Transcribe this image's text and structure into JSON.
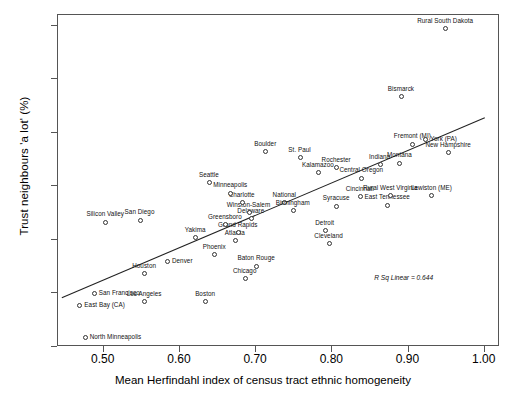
{
  "chart_data": {
    "type": "scatter",
    "title": "",
    "xlabel": "Mean Herfindahl index of census tract ethnic homogeneity",
    "ylabel": "Trust neighbours 'a lot' (%)",
    "xlim": [
      0.44,
      1.02
    ],
    "ylim": [
      20,
      82
    ],
    "xticks": [
      "0.50",
      "0.60",
      "0.70",
      "0.80",
      "0.90",
      "1.00"
    ],
    "xtick_values": [
      0.5,
      0.6,
      0.7,
      0.8,
      0.9,
      1.0
    ],
    "yticks": [
      "20",
      "30",
      "40",
      "50",
      "60",
      "70",
      "80"
    ],
    "ytick_values": [
      20,
      30,
      40,
      50,
      60,
      70,
      80
    ],
    "grid": false,
    "legend": null,
    "annotation": "R Sq Linear = 0.644",
    "fit": {
      "type": "linear",
      "r_squared": 0.644,
      "x_start": 0.445,
      "y_start": 29.2,
      "x_end": 1.0,
      "y_end": 62.8
    },
    "points": [
      {
        "label": "North Minneapolis",
        "x": 0.475,
        "y": 21.8,
        "pos": "right"
      },
      {
        "label": "East Bay (CA)",
        "x": 0.468,
        "y": 27.8,
        "pos": "right"
      },
      {
        "label": "San Francisco",
        "x": 0.487,
        "y": 30.0,
        "pos": "right"
      },
      {
        "label": "Los Angeles",
        "x": 0.553,
        "y": 28.6,
        "pos": "above"
      },
      {
        "label": "Boston",
        "x": 0.633,
        "y": 28.6,
        "pos": "above"
      },
      {
        "label": "Houston",
        "x": 0.553,
        "y": 33.8,
        "pos": "above"
      },
      {
        "label": "Denver",
        "x": 0.583,
        "y": 36.0,
        "pos": "right"
      },
      {
        "label": "Chicago",
        "x": 0.685,
        "y": 32.8,
        "pos": "above"
      },
      {
        "label": "Baton Rouge",
        "x": 0.7,
        "y": 35.2,
        "pos": "above"
      },
      {
        "label": "Phoenix",
        "x": 0.645,
        "y": 37.4,
        "pos": "above"
      },
      {
        "label": "Yakima",
        "x": 0.62,
        "y": 40.5,
        "pos": "above"
      },
      {
        "label": "Atlanta",
        "x": 0.672,
        "y": 40.0,
        "pos": "above"
      },
      {
        "label": "Grand Rapids",
        "x": 0.676,
        "y": 41.5,
        "pos": "above"
      },
      {
        "label": "Greensboro",
        "x": 0.659,
        "y": 43.0,
        "pos": "above"
      },
      {
        "label": "Delaware",
        "x": 0.693,
        "y": 44.0,
        "pos": "above"
      },
      {
        "label": "Winston-Salem",
        "x": 0.69,
        "y": 45.2,
        "pos": "above"
      },
      {
        "label": "San Diego",
        "x": 0.547,
        "y": 43.8,
        "pos": "above"
      },
      {
        "label": "Silicon Valley",
        "x": 0.502,
        "y": 43.4,
        "pos": "above"
      },
      {
        "label": "Charlotte",
        "x": 0.681,
        "y": 47.0,
        "pos": "above"
      },
      {
        "label": "Minneapolis",
        "x": 0.666,
        "y": 48.8,
        "pos": "above"
      },
      {
        "label": "Seattle",
        "x": 0.638,
        "y": 50.8,
        "pos": "above"
      },
      {
        "label": "National",
        "x": 0.737,
        "y": 47.0,
        "pos": "above"
      },
      {
        "label": "Birmingham",
        "x": 0.748,
        "y": 45.6,
        "pos": "above"
      },
      {
        "label": "Detroit",
        "x": 0.79,
        "y": 41.8,
        "pos": "above"
      },
      {
        "label": "Cleveland",
        "x": 0.795,
        "y": 39.4,
        "pos": "above"
      },
      {
        "label": "Syracuse",
        "x": 0.805,
        "y": 46.4,
        "pos": "above"
      },
      {
        "label": "Cincinnati",
        "x": 0.836,
        "y": 48.2,
        "pos": "above"
      },
      {
        "label": "East Tennessee",
        "x": 0.872,
        "y": 46.6,
        "pos": "above"
      },
      {
        "label": "Rural West Virginia",
        "x": 0.876,
        "y": 48.4,
        "pos": "above"
      },
      {
        "label": "Lewiston (ME)",
        "x": 0.93,
        "y": 48.4,
        "pos": "above"
      },
      {
        "label": "Kalamazoo",
        "x": 0.781,
        "y": 52.6,
        "pos": "above"
      },
      {
        "label": "Rochester",
        "x": 0.805,
        "y": 53.6,
        "pos": "above"
      },
      {
        "label": "Central Oregon",
        "x": 0.838,
        "y": 51.6,
        "pos": "above"
      },
      {
        "label": "Indiana",
        "x": 0.862,
        "y": 54.2,
        "pos": "above"
      },
      {
        "label": "Montana",
        "x": 0.888,
        "y": 54.4,
        "pos": "above"
      },
      {
        "label": "St. Paul",
        "x": 0.757,
        "y": 55.4,
        "pos": "above"
      },
      {
        "label": "Boulder",
        "x": 0.712,
        "y": 56.6,
        "pos": "above"
      },
      {
        "label": "Fremont (MI)",
        "x": 0.905,
        "y": 58.0,
        "pos": "above"
      },
      {
        "label": "York (PA)",
        "x": 0.922,
        "y": 58.8,
        "pos": "right"
      },
      {
        "label": "New Hampshire",
        "x": 0.952,
        "y": 56.4,
        "pos": "above"
      },
      {
        "label": "Bismarck",
        "x": 0.89,
        "y": 66.8,
        "pos": "above"
      },
      {
        "label": "Rural South Dakota",
        "x": 0.948,
        "y": 79.6,
        "pos": "above"
      }
    ]
  }
}
